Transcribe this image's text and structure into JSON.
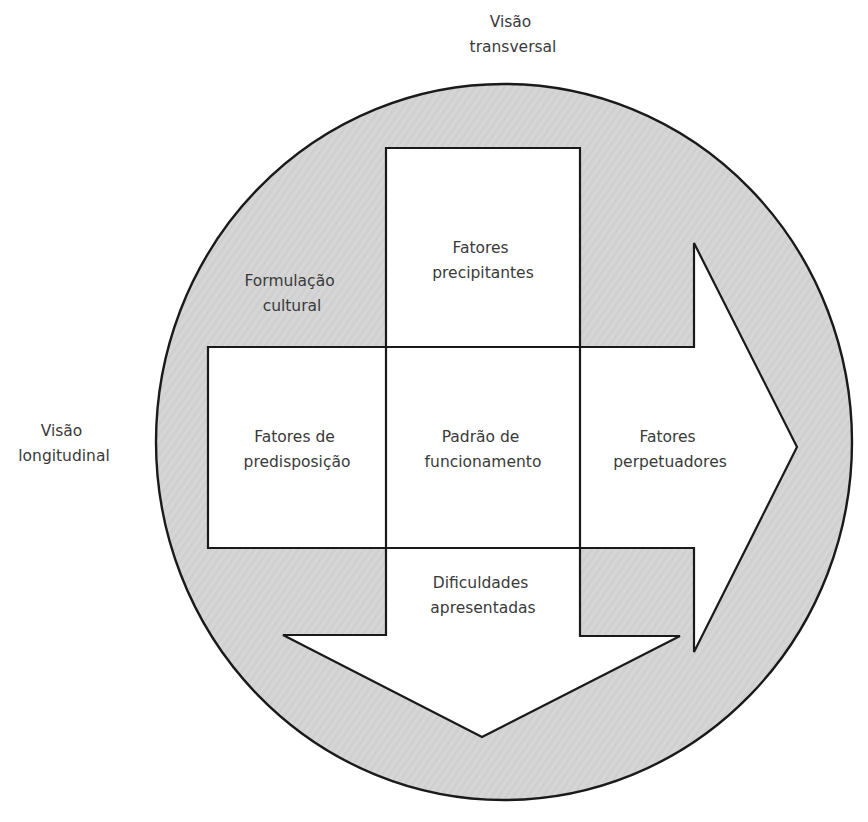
{
  "diagram": {
    "colors": {
      "circle_fill": "#d6d6d6",
      "box_fill": "#ffffff",
      "stroke": "#1a1a1a",
      "text": "#3a3a3a"
    },
    "outer_labels": {
      "transversal": [
        "Visão",
        "transversal"
      ],
      "longitudinal": [
        "Visão",
        "longitudinal"
      ]
    },
    "circle_label": [
      "Formulação",
      "cultural"
    ],
    "boxes": {
      "top": [
        "Fatores",
        "precipitantes"
      ],
      "left": [
        "Fatores de",
        "predisposição"
      ],
      "center": [
        "Padrão de",
        "funcionamento"
      ],
      "right": [
        "Fatores",
        "perpetuadores"
      ],
      "bottom": [
        "Dificuldades",
        "apresentadas"
      ]
    },
    "nodes": [
      {
        "id": "formulacao-cultural",
        "label": "Formulação cultural",
        "shape": "circle"
      },
      {
        "id": "fatores-precipitantes",
        "label": "Fatores precipitantes",
        "shape": "box"
      },
      {
        "id": "fatores-predisposicao",
        "label": "Fatores de predisposição",
        "shape": "box"
      },
      {
        "id": "padrao-funcionamento",
        "label": "Padrão de funcionamento",
        "shape": "box"
      },
      {
        "id": "fatores-perpetuadores",
        "label": "Fatores perpetuadores",
        "shape": "arrow-right"
      },
      {
        "id": "dificuldades-apresentadas",
        "label": "Dificuldades apresentadas",
        "shape": "arrow-down"
      }
    ],
    "axes": [
      {
        "label": "Visão transversal",
        "direction": "vertical (top to bottom)"
      },
      {
        "label": "Visão longitudinal",
        "direction": "horizontal (left to right)"
      }
    ]
  }
}
